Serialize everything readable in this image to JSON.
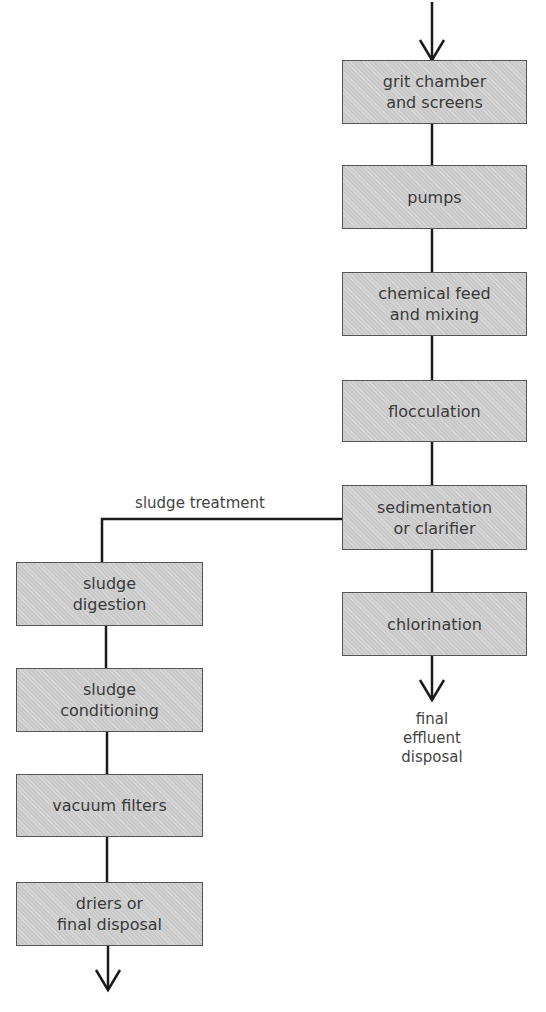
{
  "diagram": {
    "title": "",
    "main_flow": [
      {
        "id": "grit",
        "label": "grit chamber\nand screens"
      },
      {
        "id": "pumps",
        "label": "pumps"
      },
      {
        "id": "chem",
        "label": "chemical feed\nand mixing"
      },
      {
        "id": "floc",
        "label": "flocculation"
      },
      {
        "id": "sed",
        "label": "sedimentation\nor clarifier"
      },
      {
        "id": "chlor",
        "label": "chlorination"
      }
    ],
    "sludge_flow": [
      {
        "id": "digest",
        "label": "sludge\ndigestion"
      },
      {
        "id": "cond",
        "label": "sludge\nconditioning"
      },
      {
        "id": "vac",
        "label": "vacuum filters"
      },
      {
        "id": "dry",
        "label": "driers or\nfinal disposal"
      }
    ],
    "labels": {
      "sludge_branch": "sludge treatment",
      "outlet": "final\neffluent\ndisposal"
    },
    "edges": [
      [
        "input",
        "grit"
      ],
      [
        "grit",
        "pumps"
      ],
      [
        "pumps",
        "chem"
      ],
      [
        "chem",
        "floc"
      ],
      [
        "floc",
        "sed"
      ],
      [
        "sed",
        "chlor"
      ],
      [
        "chlor",
        "outlet"
      ],
      [
        "sed",
        "digest"
      ],
      [
        "digest",
        "cond"
      ],
      [
        "cond",
        "vac"
      ],
      [
        "vac",
        "dry"
      ],
      [
        "dry",
        "output"
      ]
    ]
  }
}
